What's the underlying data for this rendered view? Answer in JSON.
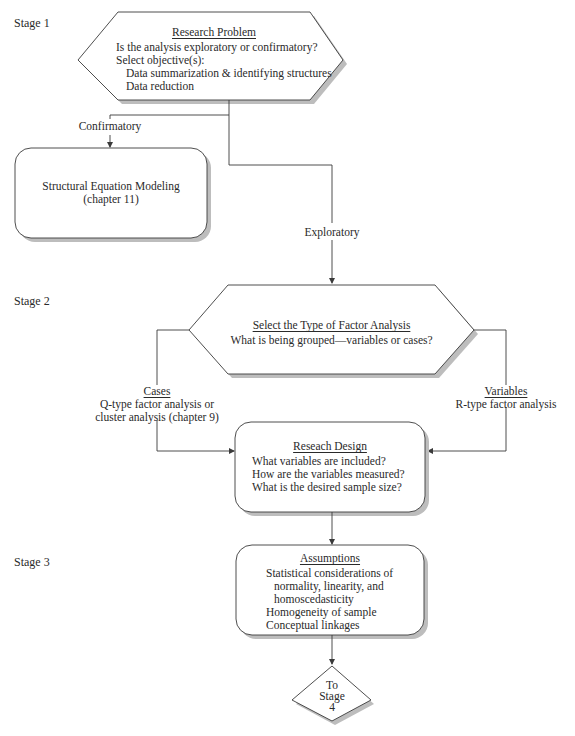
{
  "stages": {
    "stage1": "Stage 1",
    "stage2": "Stage 2",
    "stage3": "Stage 3"
  },
  "research_problem": {
    "title": "Research Problem",
    "question": "Is the analysis exploratory or confirmatory?",
    "objectives_label": "Select objective(s):",
    "objectives": [
      "Data summarization & identifying structures",
      "Data reduction"
    ]
  },
  "branches": {
    "confirmatory": "Confirmatory",
    "exploratory": "Exploratory"
  },
  "sem_box": {
    "line1": "Structural Equation Modeling",
    "line2": "(chapter 11)"
  },
  "factor_type": {
    "title": "Select the Type of Factor Analysis",
    "question": "What is being grouped—variables or cases?"
  },
  "cases": {
    "title": "Cases",
    "line1": "Q-type factor analysis or",
    "line2": "cluster analysis (chapter 9)"
  },
  "variables": {
    "title": "Variables",
    "line1": "R-type factor analysis"
  },
  "research_design": {
    "title": "Reseach Design",
    "items": [
      "What variables are included?",
      "How are the variables measured?",
      "What is the desired sample size?"
    ]
  },
  "assumptions": {
    "title": "Assumptions",
    "items": [
      "Statistical considerations of",
      "normality, linearity, and",
      "homoscedasticity",
      "Homogeneity of sample",
      "Conceptual linkages"
    ]
  },
  "to_stage": {
    "line1": "To",
    "line2": "Stage",
    "line3": "4"
  },
  "colors": {
    "stroke": "#3a3a3a",
    "shadow": "#b8b8b8",
    "background": "#ffffff"
  }
}
